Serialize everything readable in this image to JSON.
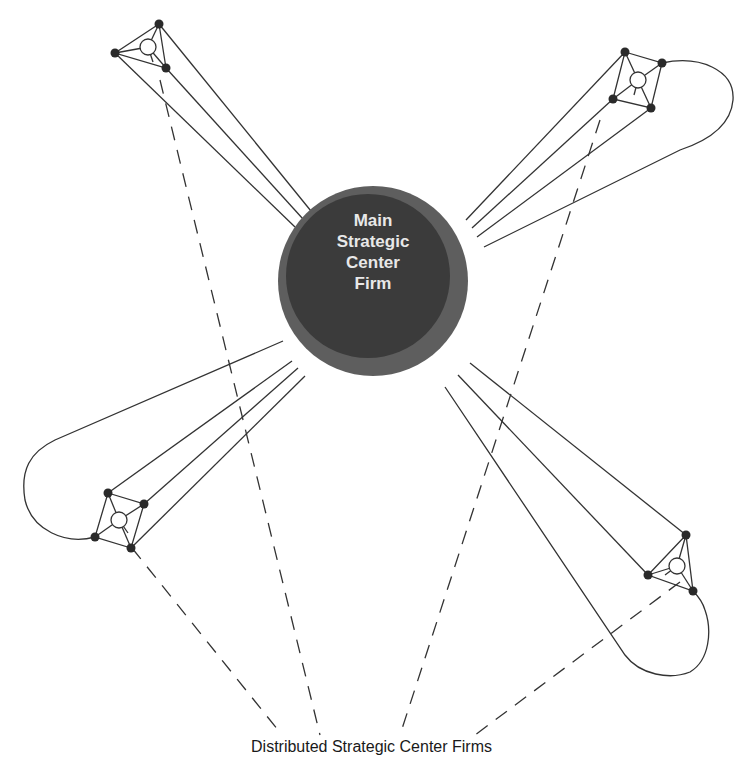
{
  "diagram": {
    "center_firm": {
      "lines": [
        "Main",
        "Strategic",
        "Center",
        "Firm"
      ],
      "fill_outer": "#5e5e5e",
      "fill_inner": "#3b3b3b"
    },
    "caption": "Distributed Strategic Center Firms",
    "clusters": [
      {
        "name": "top-left-cluster"
      },
      {
        "name": "top-right-cluster"
      },
      {
        "name": "bottom-left-cluster"
      },
      {
        "name": "bottom-right-cluster"
      }
    ],
    "line_color": "#333333",
    "node_color": "#2a2a2a"
  }
}
